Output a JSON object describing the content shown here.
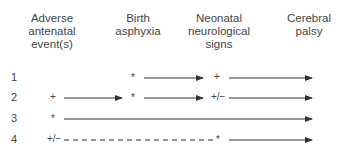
{
  "columns": [
    {
      "label_lines": [
        "Adverse",
        "antenatal",
        "event(s)"
      ]
    },
    {
      "label_lines": [
        "Birth",
        "asphyxia"
      ]
    },
    {
      "label_lines": [
        "Neonatal",
        "neurological",
        "signs"
      ]
    },
    {
      "label_lines": [
        "Cerebral",
        "palsy"
      ]
    }
  ],
  "rows": [
    {
      "number": "1",
      "marks": [
        "",
        "*",
        "+"
      ]
    },
    {
      "number": "2",
      "marks": [
        "+",
        "*",
        "+/−"
      ]
    },
    {
      "number": "3",
      "marks": [
        "*",
        "",
        ""
      ]
    },
    {
      "number": "4",
      "marks": [
        "+/−",
        "",
        "*"
      ]
    }
  ]
}
